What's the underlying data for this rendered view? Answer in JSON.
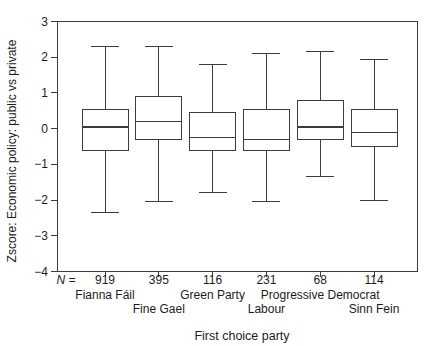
{
  "figure": {
    "bg_color": "#ffffff",
    "line_color": "#3c3c3c",
    "text_color": "#1c1c1c",
    "box_fill": "#ffffff"
  },
  "chart_data": {
    "type": "boxplot",
    "title": "",
    "xlabel": "First choice party",
    "ylabel": "Zscore: Economic policy: public vs private",
    "n_prefix": "N =",
    "ylim": [
      -4,
      3
    ],
    "yticks": [
      3,
      2,
      1,
      0,
      -1,
      -2,
      -3,
      -4
    ],
    "grid": false,
    "categories": [
      {
        "label": "Fianna Fáil",
        "n": "919",
        "row": 1
      },
      {
        "label": "Fine Gael",
        "n": "395",
        "row": 2
      },
      {
        "label": "Green Party",
        "n": "116",
        "row": 1
      },
      {
        "label": "Labour",
        "n": "231",
        "row": 2
      },
      {
        "label": "Progressive Democrat",
        "n": "68",
        "row": 1
      },
      {
        "label": "Sinn Fein",
        "n": "114",
        "row": 2
      }
    ],
    "series": [
      {
        "name": "Fianna Fáil",
        "whisker_low": -2.35,
        "q1": -0.6,
        "median": 0.05,
        "q3": 0.55,
        "whisker_high": 2.3
      },
      {
        "name": "Fine Gael",
        "whisker_low": -2.05,
        "q1": -0.3,
        "median": 0.2,
        "q3": 0.9,
        "whisker_high": 2.3
      },
      {
        "name": "Green Party",
        "whisker_low": -1.8,
        "q1": -0.6,
        "median": -0.25,
        "q3": 0.45,
        "whisker_high": 1.8
      },
      {
        "name": "Labour",
        "whisker_low": -2.05,
        "q1": -0.6,
        "median": -0.3,
        "q3": 0.55,
        "whisker_high": 2.1
      },
      {
        "name": "Progressive Democrat",
        "whisker_low": -1.35,
        "q1": -0.3,
        "median": 0.05,
        "q3": 0.8,
        "whisker_high": 2.15
      },
      {
        "name": "Sinn Fein",
        "whisker_low": -2.0,
        "q1": -0.5,
        "median": -0.1,
        "q3": 0.55,
        "whisker_high": 1.95
      }
    ]
  }
}
